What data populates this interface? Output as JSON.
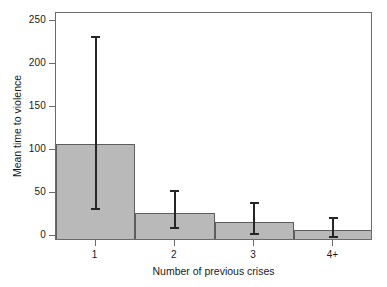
{
  "chart_data": {
    "type": "bar",
    "title": "",
    "xlabel": "Number of previous crises",
    "ylabel": "Mean time to violence",
    "categories": [
      "1",
      "2",
      "3",
      "4+"
    ],
    "values": [
      107,
      27,
      16,
      7
    ],
    "series": [
      {
        "name": "Mean time to violence",
        "values": [
          107,
          27,
          16,
          7
        ]
      }
    ],
    "error_bars": {
      "lower": [
        33,
        11,
        4,
        0
      ],
      "upper": [
        233,
        53,
        40,
        22
      ]
    },
    "yticks": [
      0,
      50,
      100,
      150,
      200,
      250
    ],
    "ytick_labels": [
      "0",
      "50",
      "100",
      "150",
      "200",
      "250"
    ],
    "ylim": [
      0,
      258
    ],
    "xtick_labels": [
      "1",
      "2",
      "3",
      "4+"
    ],
    "grid": false,
    "legend": null,
    "bar_color": "#b9b9b9",
    "bar_edge_color": "#5e5e5e",
    "error_color": "#262626",
    "axis_color": "#6b6b6b"
  },
  "caption_sliver": "",
  "icons": {}
}
